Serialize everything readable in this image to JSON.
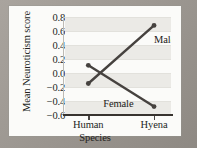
{
  "figure": {
    "background_color": "#9a9590",
    "card_color": "#fbfbf9",
    "line_color": "#46423f",
    "text_color": "#231f1d"
  },
  "chart_data": {
    "type": "line",
    "title": "",
    "xlabel": "Species",
    "ylabel": "Mean Neuroticism score",
    "categories": [
      "Human",
      "Hyena"
    ],
    "x": [
      0,
      1
    ],
    "ylim": [
      -0.6,
      0.8
    ],
    "yticks": [
      0.8,
      0.6,
      0.4,
      0.2,
      0.0,
      -0.2,
      -0.4,
      -0.6
    ],
    "ytick_labels": [
      "0.8",
      "0.6",
      "0.4",
      "0.2",
      "0.0",
      "−0.2",
      "−0.4",
      "−0.6"
    ],
    "xtick_labels": [
      "Human",
      "Hyena"
    ],
    "grid": true,
    "grid_orientation": "horizontal",
    "legend_position": "inline-annotations",
    "series": [
      {
        "name": "Male",
        "values": [
          -0.15,
          0.68
        ],
        "marker": "circle",
        "label": "Male",
        "label_x_frac": 0.84,
        "label_y_value": 0.47
      },
      {
        "name": "Female",
        "values": [
          0.11,
          -0.48
        ],
        "marker": "circle",
        "label": "Female",
        "label_x_frac": 0.36,
        "label_y_value": -0.44
      }
    ],
    "annotations": [
      {
        "text": "Male",
        "series": "Male"
      },
      {
        "text": "Female",
        "series": "Female"
      }
    ]
  }
}
